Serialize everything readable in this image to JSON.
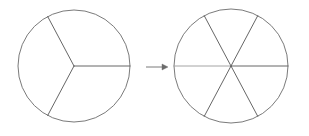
{
  "figure": {
    "background_color": "#ffffff",
    "width": 309,
    "height": 136,
    "stroke_color_outline": "#6b6b6b",
    "stroke_color_divider": "#555555",
    "stroke_color_light_divider": "#9a9a9a",
    "stroke_color_arrow": "#6b6b6b",
    "stroke_width_outline": 0.9,
    "stroke_width_divider": 0.9,
    "stroke_width_arrow": 0.9
  },
  "shapes": [
    {
      "name": "left-circle",
      "label": "circle divided into three equal sectors",
      "cx": 74,
      "cy": 66,
      "r": 56,
      "sector_count": 3,
      "divider_angles_deg": [
        0,
        118,
        242
      ]
    },
    {
      "name": "right-circle",
      "label": "circle divided into six equal sectors",
      "cx": 231,
      "cy": 66,
      "r": 57,
      "sector_count": 6,
      "divider_angles_deg": [
        0,
        62,
        118,
        180,
        242,
        298
      ]
    }
  ],
  "arrow": {
    "name": "transformation-arrow",
    "label": "right arrow",
    "direction": "right",
    "x1": 146,
    "x2": 168,
    "y": 67,
    "head_length": 6,
    "head_half_width": 3
  }
}
